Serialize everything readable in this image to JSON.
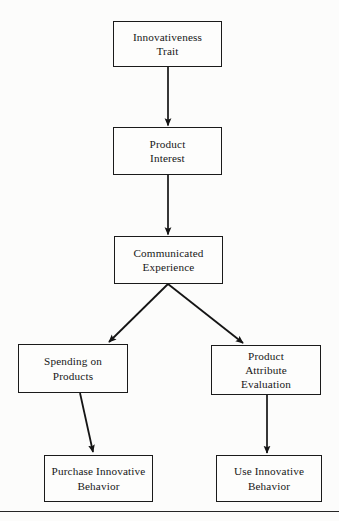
{
  "diagram": {
    "type": "flowchart",
    "background_color": "#fcfcfb",
    "line_color": "#1a1a1a",
    "text_color": "#171717",
    "nodes": [
      {
        "id": "innovativeness-trait",
        "label": "Innovativeness\nTrait",
        "shape": "rectangle",
        "x": 113,
        "y": 21,
        "width": 109,
        "height": 46
      },
      {
        "id": "product-interest",
        "label": "Product\nInterest",
        "shape": "rectangle",
        "x": 113,
        "y": 127,
        "width": 109,
        "height": 48
      },
      {
        "id": "communicated-experience",
        "label": "Communicated\nExperience",
        "shape": "rectangle",
        "x": 114,
        "y": 236,
        "width": 109,
        "height": 48
      },
      {
        "id": "spending-on-products",
        "label": "Spending on\nProducts",
        "shape": "rectangle",
        "x": 18,
        "y": 344,
        "width": 110,
        "height": 49
      },
      {
        "id": "product-attribute-evaluation",
        "label": "Product\nAttribute\nEvaluation",
        "shape": "rectangle",
        "x": 211,
        "y": 345,
        "width": 110,
        "height": 50
      },
      {
        "id": "purchase-innovative-behavior",
        "label": "Purchase Innovative\nBehavior",
        "shape": "rectangle",
        "x": 44,
        "y": 455,
        "width": 109,
        "height": 47
      },
      {
        "id": "use-innovative-behavior",
        "label": "Use Innovative\nBehavior",
        "shape": "rectangle",
        "x": 216,
        "y": 455,
        "width": 106,
        "height": 47
      }
    ],
    "edges": [
      {
        "id": "edge-trait-to-interest",
        "from": "innovativeness-trait",
        "to": "product-interest",
        "style": "straight-arrow"
      },
      {
        "id": "edge-interest-to-experience",
        "from": "product-interest",
        "to": "communicated-experience",
        "style": "straight-arrow"
      },
      {
        "id": "edge-experience-to-spending",
        "from": "communicated-experience",
        "to": "spending-on-products",
        "style": "diagonal-arrow"
      },
      {
        "id": "edge-experience-to-attribute",
        "from": "communicated-experience",
        "to": "product-attribute-evaluation",
        "style": "diagonal-arrow"
      },
      {
        "id": "edge-spending-to-purchase",
        "from": "spending-on-products",
        "to": "purchase-innovative-behavior",
        "style": "diagonal-arrow"
      },
      {
        "id": "edge-attribute-to-use",
        "from": "product-attribute-evaluation",
        "to": "use-innovative-behavior",
        "style": "straight-arrow"
      }
    ],
    "footer_rule": true
  }
}
